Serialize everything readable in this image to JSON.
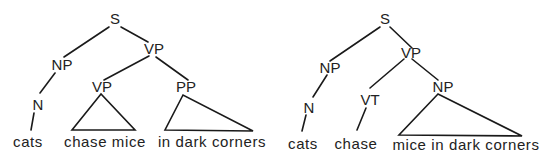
{
  "diagram": {
    "type": "syntax-tree-comparison",
    "trees": [
      {
        "name": "tree-pp-attached-to-vp",
        "nodes": {
          "s": "S",
          "np": "NP",
          "vp": "VP",
          "n": "N",
          "vp_inner": "VP",
          "pp": "PP"
        },
        "leaves": {
          "cats": "cats",
          "chase_mice": "chase mice",
          "in_dark_corners": "in dark corners"
        },
        "edges": [
          [
            "S",
            "NP"
          ],
          [
            "S",
            "VP"
          ],
          [
            "NP",
            "N"
          ],
          [
            "N",
            "cats"
          ],
          [
            "VP",
            "VP"
          ],
          [
            "VP",
            "PP"
          ]
        ],
        "triangles": [
          {
            "node": "VP",
            "covers": "chase mice"
          },
          {
            "node": "PP",
            "covers": "in dark corners"
          }
        ]
      },
      {
        "name": "tree-pp-attached-to-np",
        "nodes": {
          "s": "S",
          "np": "NP",
          "vp": "VP",
          "n": "N",
          "vt": "VT",
          "np_obj": "NP"
        },
        "leaves": {
          "cats": "cats",
          "chase": "chase",
          "mice_in_dark_corners": "mice in dark corners"
        },
        "edges": [
          [
            "S",
            "NP"
          ],
          [
            "S",
            "VP"
          ],
          [
            "NP",
            "N"
          ],
          [
            "N",
            "cats"
          ],
          [
            "VP",
            "VT"
          ],
          [
            "VP",
            "NP"
          ],
          [
            "VT",
            "chase"
          ]
        ],
        "triangles": [
          {
            "node": "NP",
            "covers": "mice in dark corners"
          }
        ]
      }
    ]
  }
}
